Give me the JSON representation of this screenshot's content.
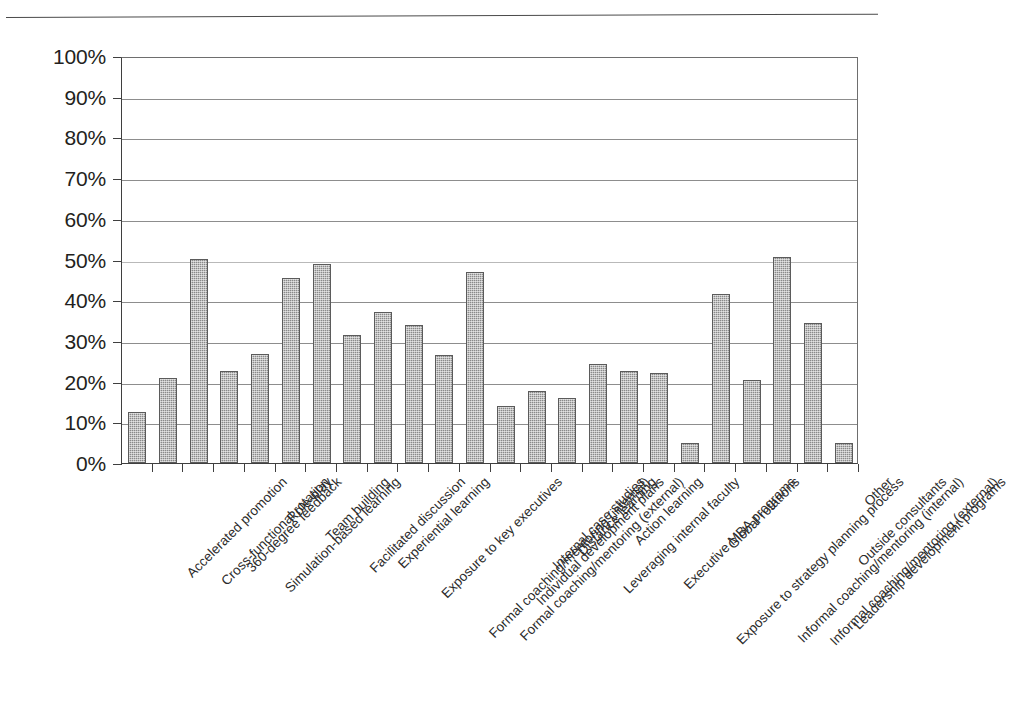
{
  "figure": {
    "background_color": "#ffffff",
    "bar_color": "#8a8a8a",
    "bar_edge_color": "#5b5b5b",
    "gridline_color": "#8d8d8d",
    "axis_color": "#3f3f3f",
    "text_color": "#231f20"
  },
  "chart_data": {
    "type": "bar",
    "title": "",
    "subtitle": "",
    "xlabel": "",
    "ylabel": "",
    "ylim": [
      0,
      100
    ],
    "y_tick_labels": [
      "0%",
      "10%",
      "20%",
      "30%",
      "40%",
      "50%",
      "60%",
      "70%",
      "80%",
      "90%",
      "100%"
    ],
    "y_tick_values": [
      0,
      10,
      20,
      30,
      40,
      50,
      60,
      70,
      80,
      90,
      100
    ],
    "grid": "horizontal",
    "legend": "none",
    "value_unit": "%",
    "categories": [
      "Accelerated promotion",
      "Cross-functional rotation",
      "360-degree feedback",
      "Simulation-based learning",
      "Role-play",
      "Team building",
      "Facilitated discussion",
      "Experiential learning",
      "Exposure to key executives",
      "Formal coaching/mentoring (internal)",
      "Formal coaching/mentoring (external)",
      "Individual development plans",
      "Internal case studies",
      "Distance learning",
      "Leveraging internal faculty",
      "Action learning",
      "Executive MBA programs",
      "Exposure to strategy planning process",
      "Global rotations",
      "Informal coaching/mentoring (internal)",
      "Informal coaching/mentoring (external)",
      "Leadership development programs",
      "Outside consultants",
      "Other"
    ],
    "values": [
      12.5,
      20.8,
      50.2,
      22.5,
      26.8,
      45.5,
      49.0,
      31.5,
      37.0,
      34.0,
      26.5,
      47.0,
      14.0,
      17.6,
      16.0,
      24.4,
      22.5,
      22.0,
      5.0,
      41.5,
      20.5,
      50.5,
      34.5,
      5.0
    ]
  }
}
